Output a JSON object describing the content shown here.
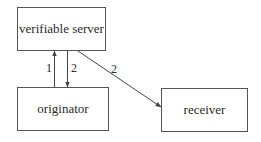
{
  "diagram": {
    "type": "flow",
    "nodes": [
      {
        "id": "server",
        "label": "verifiable server"
      },
      {
        "id": "originator",
        "label": "originator"
      },
      {
        "id": "receiver",
        "label": "receiver"
      }
    ],
    "edges": [
      {
        "from": "originator",
        "to": "server",
        "label": "1"
      },
      {
        "from": "server",
        "to": "originator",
        "label": "2"
      },
      {
        "from": "server",
        "to": "receiver",
        "label": "2"
      }
    ]
  }
}
